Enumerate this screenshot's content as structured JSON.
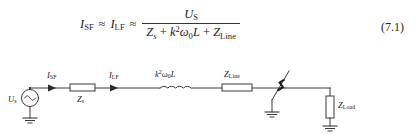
{
  "figure": {
    "kind": "circuit-diagram-with-equation",
    "line_color": "#333333",
    "text_color": "#1a1a1a"
  },
  "equation": {
    "number": "(7.1)",
    "lhs_current_1": "I",
    "lhs_current_1_sub": "SF",
    "approx_1": "≈",
    "lhs_current_2": "I",
    "lhs_current_2_sub": "LF",
    "approx_2": "≈",
    "numerator_symbol": "U",
    "numerator_sub": "S",
    "den_z_source": "Z",
    "den_z_source_sub": "s",
    "den_plus_1": "+",
    "den_k": "k",
    "den_k_sup": "2",
    "den_omega": "ω",
    "den_omega_sub": "0",
    "den_L": "L",
    "den_plus_2": "+",
    "den_z_line": "Z",
    "den_z_line_sub": "Line",
    "plain_text": "I_SF ≈ I_LF ≈ U_S / (Z_s + k²ω₀L + Z_Line)"
  },
  "circuit": {
    "source": {
      "label_symbol": "U",
      "label_sub": "s",
      "type": "ac-voltage-source"
    },
    "impedance_source": {
      "label_symbol": "Z",
      "label_sub": "s",
      "type": "impedance-box"
    },
    "current_sf": {
      "label_symbol": "I",
      "label_sub": "SF",
      "type": "current-arrow"
    },
    "current_lf": {
      "label_symbol": "I",
      "label_sub": "LF",
      "type": "current-arrow"
    },
    "inductor": {
      "label_k": "k",
      "label_k_sup": "2",
      "label_omega": "ω",
      "label_omega_sub": "0",
      "label_L": "L",
      "type": "inductor-coil"
    },
    "impedance_line": {
      "label_symbol": "Z",
      "label_sub": "Line",
      "type": "impedance-box"
    },
    "fault": {
      "type": "arcing-fault-to-ground",
      "label": ""
    },
    "impedance_load": {
      "label_symbol": "Z",
      "label_sub": "Load",
      "type": "impedance-box-vertical"
    },
    "grounds": [
      "source-ground",
      "fault-ground",
      "load-ground"
    ]
  }
}
